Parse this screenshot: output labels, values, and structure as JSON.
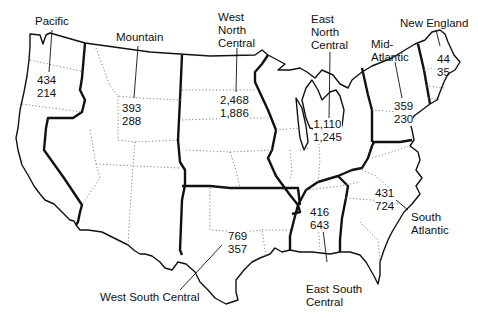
{
  "map": {
    "type": "choropleth-label-map",
    "subject": "United States census divisions",
    "regions": [
      {
        "id": "pacific",
        "name": "Pacific",
        "value_top": "434",
        "value_bottom": "214"
      },
      {
        "id": "mountain",
        "name": "Mountain",
        "value_top": "393",
        "value_bottom": "288"
      },
      {
        "id": "west-north-central",
        "name": "West North Central",
        "name_lines": [
          "West",
          "North",
          "Central"
        ],
        "value_top": "2,468",
        "value_bottom": "1,886"
      },
      {
        "id": "east-north-central",
        "name": "East North Central",
        "name_lines": [
          "East",
          "North",
          "Central"
        ],
        "value_top": "1,110",
        "value_bottom": "1,245"
      },
      {
        "id": "mid-atlantic",
        "name": "Mid-Atlantic",
        "name_lines": [
          "Mid-",
          "Atlantic"
        ],
        "value_top": "359",
        "value_bottom": "230"
      },
      {
        "id": "new-england",
        "name": "New England",
        "value_top": "44",
        "value_bottom": "35"
      },
      {
        "id": "south-atlantic",
        "name": "South Atlantic",
        "name_lines": [
          "South",
          "Atlantic"
        ],
        "value_top": "431",
        "value_bottom": "724"
      },
      {
        "id": "east-south-central",
        "name": "East South Central",
        "name_lines": [
          "East South",
          "Central"
        ],
        "value_top": "416",
        "value_bottom": "643"
      },
      {
        "id": "west-south-central",
        "name": "West South Central",
        "value_top": "769",
        "value_bottom": "357"
      }
    ]
  },
  "labels": {
    "pacific": "Pacific",
    "mountain": "Mountain",
    "wnc1": "West",
    "wnc2": "North",
    "wnc3": "Central",
    "enc1": "East",
    "enc2": "North",
    "enc3": "Central",
    "ma1": "Mid-",
    "ma2": "Atlantic",
    "ne": "New England",
    "sa1": "South",
    "sa2": "Atlantic",
    "esc1": "East South",
    "esc2": "Central",
    "wsc": "West South Central"
  },
  "values": {
    "pacific": [
      "434",
      "214"
    ],
    "mountain": [
      "393",
      "288"
    ],
    "wnc": [
      "2,468",
      "1,886"
    ],
    "enc": [
      "1,110",
      "1,245"
    ],
    "ma": [
      "359",
      "230"
    ],
    "ne": [
      "44",
      "35"
    ],
    "sa": [
      "431",
      "724"
    ],
    "esc": [
      "416",
      "643"
    ],
    "wsc": [
      "769",
      "357"
    ]
  }
}
